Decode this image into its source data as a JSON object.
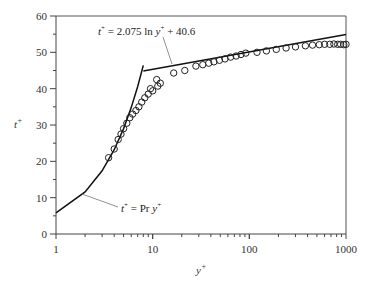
{
  "chart_data": {
    "type": "scatter",
    "title": "",
    "xlabel": "y+",
    "ylabel": "t+",
    "xscale": "log",
    "xlim": [
      1,
      1000
    ],
    "ylim": [
      0,
      60
    ],
    "xticks": [
      "1",
      "10",
      "100",
      "1000"
    ],
    "yticks": [
      "0",
      "10",
      "20",
      "30",
      "40",
      "50",
      "60"
    ],
    "grid": false,
    "legend": null,
    "annotations": [
      {
        "text_prefix": "t",
        "sup": "+",
        "text_mid": " = 2.075 ln y",
        "sup2": "+",
        "text_suffix": " + 40.6",
        "label": "t+ = 2.075 ln y+ + 40.6"
      },
      {
        "text_prefix": "t",
        "sup": "+",
        "text_mid": " = Pr y",
        "sup2": "+",
        "text_suffix": "",
        "label": "t+ = Pr y+"
      }
    ],
    "series": [
      {
        "name": "t+ = Pr y+ (conduction sublayer)",
        "type": "line",
        "x": [
          1,
          2,
          3,
          4,
          5,
          6,
          7,
          8
        ],
        "y": [
          5.8,
          11.6,
          17.4,
          23.2,
          29.0,
          34.8,
          40.6,
          46.4
        ]
      },
      {
        "name": "t+ = 2.075 ln y+ + 40.6 (log law)",
        "type": "line",
        "x": [
          8,
          1000
        ],
        "y": [
          44.9,
          54.9
        ]
      },
      {
        "name": "Experimental data",
        "type": "scatter",
        "marker": "open-circle",
        "x": [
          3.5,
          4.0,
          4.4,
          4.7,
          5.0,
          5.4,
          5.8,
          6.2,
          6.7,
          7.2,
          7.7,
          8.3,
          9.0,
          9.5,
          10.0,
          11.0,
          11.3,
          12.0,
          16.5,
          21.5,
          28,
          33,
          38,
          43,
          49,
          56,
          64,
          73,
          82,
          92,
          120,
          150,
          190,
          240,
          300,
          380,
          450,
          530,
          600,
          680,
          750,
          820,
          880,
          950,
          1000
        ],
        "y": [
          21.0,
          23.4,
          26.0,
          27.5,
          29.0,
          30.5,
          32.0,
          33.0,
          34.0,
          35.0,
          36.3,
          37.5,
          38.5,
          40.0,
          39.4,
          42.5,
          40.7,
          41.5,
          44.3,
          45.0,
          46.2,
          46.6,
          47.0,
          47.4,
          47.8,
          48.2,
          48.7,
          49.0,
          49.4,
          49.8,
          50.0,
          50.4,
          50.8,
          51.2,
          51.5,
          51.8,
          52.0,
          52.1,
          52.2,
          52.2,
          52.3,
          52.2,
          52.2,
          52.1,
          52.2
        ]
      }
    ]
  },
  "axes": {
    "x_label_main": "y",
    "x_label_sup": "+",
    "y_label_main": "t",
    "y_label_sup": "+"
  }
}
